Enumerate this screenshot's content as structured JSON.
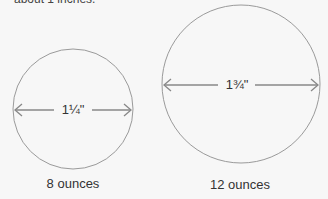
{
  "intro_text": "about 1 inches.",
  "diagram": {
    "small": {
      "diameter_label": "1¼\"",
      "caption": "8 ounces"
    },
    "large": {
      "diameter_label": "1¾\"",
      "caption": "12 ounces"
    },
    "colors": {
      "circle": "#999999",
      "arrow": "#888888",
      "text": "#333333",
      "background": "#f7f7f7"
    }
  }
}
